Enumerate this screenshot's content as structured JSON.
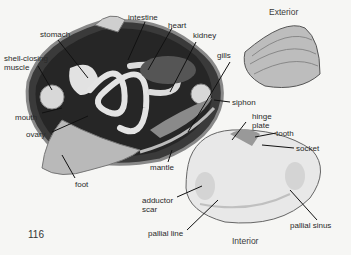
{
  "figure": {
    "page_number": "116",
    "views": {
      "exterior": "Exterior",
      "interior": "Interior"
    },
    "labels": {
      "intestine": "intestine",
      "heart": "heart",
      "stomach": "stomach",
      "kidney": "kidney",
      "gills": "gills",
      "shell_closing_muscle_1": "shell-closing",
      "shell_closing_muscle_2": "muscle",
      "mouth": "mouth",
      "ovary": "ovary",
      "siphon": "siphon",
      "foot": "foot",
      "mantle": "mantle",
      "hinge_plate_1": "hinge",
      "hinge_plate_2": "plate",
      "tooth": "tooth",
      "socket": "socket",
      "adductor_scar_1": "adductor",
      "adductor_scar_2": "scar",
      "pallial_line": "pallial line",
      "pallial_sinus": "pallial sinus"
    },
    "colors": {
      "background": "#f6f6f4",
      "body_cavity": "#2b2b2b",
      "organ_light": "#dcdcdc",
      "shell": "#c9c9c9",
      "leader": "#111111"
    }
  }
}
